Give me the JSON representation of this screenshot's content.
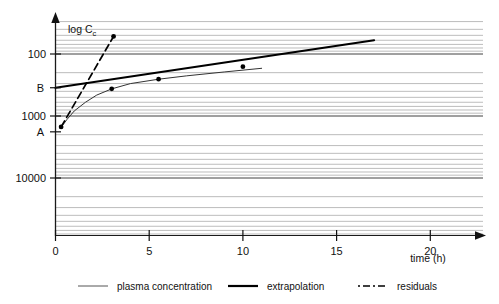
{
  "chart_data": {
    "type": "line",
    "title": "",
    "xlabel": "time (h)",
    "ylabel": "log C",
    "ylabel_sub": "c",
    "yscale": "log",
    "ylim": [
      10,
      30000
    ],
    "xlim": [
      0,
      23
    ],
    "grid": true,
    "xticks": [
      0,
      5,
      10,
      15,
      20
    ],
    "xticklabels": [
      "0",
      "5",
      "10",
      "15",
      "20"
    ],
    "yticks": [
      10,
      100,
      1000,
      10000
    ],
    "yticklabels": [
      "10",
      "100",
      "1000",
      "10000"
    ],
    "annotations": [
      {
        "text": "A",
        "x": 0,
        "y": 1800
      },
      {
        "text": "B",
        "x": 0,
        "y": 350
      }
    ],
    "series": [
      {
        "name": "plasma concentration",
        "style": "thin-solid",
        "color": "#333333",
        "points": [
          {
            "x": 0.25,
            "y": 1600
          },
          {
            "x": 0.6,
            "y": 1150
          },
          {
            "x": 1.0,
            "y": 830
          },
          {
            "x": 1.6,
            "y": 600
          },
          {
            "x": 2.2,
            "y": 460
          },
          {
            "x": 3.0,
            "y": 365
          },
          {
            "x": 4.0,
            "y": 300
          },
          {
            "x": 5.5,
            "y": 255
          },
          {
            "x": 7.0,
            "y": 225
          },
          {
            "x": 9.0,
            "y": 195
          },
          {
            "x": 11.0,
            "y": 170
          }
        ]
      },
      {
        "name": "extrapolation",
        "style": "thick-solid",
        "color": "#000000",
        "points": [
          {
            "x": 0,
            "y": 350
          },
          {
            "x": 17,
            "y": 60
          }
        ],
        "markers": [
          {
            "x": 3.0,
            "y": 365
          },
          {
            "x": 5.5,
            "y": 255
          },
          {
            "x": 10.0,
            "y": 160
          }
        ]
      },
      {
        "name": "residuals",
        "style": "dashed",
        "color": "#000000",
        "points": [
          {
            "x": 0.3,
            "y": 1500
          },
          {
            "x": 3.1,
            "y": 52
          }
        ],
        "markers": [
          {
            "x": 0.3,
            "y": 1500
          },
          {
            "x": 3.1,
            "y": 52
          }
        ]
      }
    ],
    "legend": {
      "position": "bottom",
      "entries": [
        {
          "label": "plasma concentration",
          "style": "thin-solid"
        },
        {
          "label": "extrapolation",
          "style": "thick-solid"
        },
        {
          "label": "residuals",
          "style": "dashed"
        }
      ]
    }
  }
}
